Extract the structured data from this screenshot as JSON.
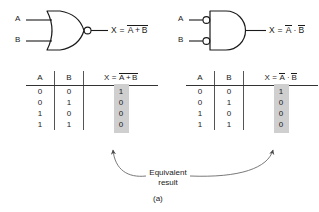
{
  "figure": {
    "caption": "(a)",
    "annotation": {
      "line1": "Equivalent",
      "line2": "result"
    }
  },
  "gates": [
    {
      "id": "nor-gate",
      "type": "NOR",
      "inputs": [
        {
          "label": "A"
        },
        {
          "label": "B"
        }
      ],
      "output_expression": {
        "lhs": "X",
        "eq": "=",
        "overbar_all": true,
        "terms": [
          "A",
          "+",
          "B"
        ],
        "plain": "X = A + B (overbarred)"
      },
      "bubble_position": "output"
    },
    {
      "id": "negative-and-gate",
      "type": "AND with inverted inputs",
      "inputs": [
        {
          "label": "A"
        },
        {
          "label": "B"
        }
      ],
      "output_expression": {
        "lhs": "X",
        "eq": "=",
        "overbar_all": false,
        "terms": [
          "A",
          "·",
          "B"
        ],
        "plain": "X = A-bar · B-bar"
      },
      "bubble_position": "inputs"
    }
  ],
  "tables": [
    {
      "id": "nor-truth-table",
      "headers": {
        "a": "A",
        "b": "B",
        "x_lhs": "X",
        "x_eq": "=",
        "x_terms": [
          "A",
          "+",
          "B"
        ],
        "x_overbar_all": true
      },
      "rows": [
        {
          "a": "0",
          "b": "0",
          "x": "1"
        },
        {
          "a": "0",
          "b": "1",
          "x": "0"
        },
        {
          "a": "1",
          "b": "0",
          "x": "0"
        },
        {
          "a": "1",
          "b": "1",
          "x": "0"
        }
      ],
      "highlight_color": "#cfcfcf"
    },
    {
      "id": "negative-and-truth-table",
      "headers": {
        "a": "A",
        "b": "B",
        "x_lhs": "X",
        "x_eq": "=",
        "x_terms": [
          "A",
          "·",
          "B"
        ],
        "x_overbar_all": false
      },
      "rows": [
        {
          "a": "0",
          "b": "0",
          "x": "1"
        },
        {
          "a": "0",
          "b": "1",
          "x": "0"
        },
        {
          "a": "1",
          "b": "0",
          "x": "0"
        },
        {
          "a": "1",
          "b": "1",
          "x": "0"
        }
      ],
      "highlight_color": "#cfcfcf"
    }
  ],
  "colors": {
    "ink": "#1a1a1a",
    "rule": "#333333",
    "divider": "#555555",
    "highlight": "#cfcfcf",
    "arrow": "#555555"
  }
}
